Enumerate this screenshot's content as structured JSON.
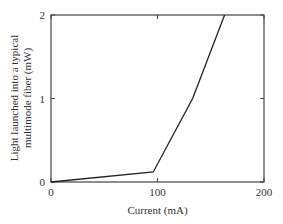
{
  "chart_data": {
    "type": "line",
    "title": "",
    "xlabel": "Current (mA)",
    "ylabel_lines": [
      "Light launched into a typical",
      "multimode fiber (mW)"
    ],
    "ylabel": "Light launched into a typical multimode fiber (mW)",
    "xlim": [
      0,
      200
    ],
    "ylim": [
      0,
      2
    ],
    "x_ticks": [
      0,
      100,
      200
    ],
    "x_tick_labels": [
      "0",
      "100",
      "200"
    ],
    "y_ticks": [
      0,
      1,
      2
    ],
    "y_tick_labels": [
      "0",
      "1",
      "2"
    ],
    "grid": false,
    "legend": null,
    "series": [
      {
        "name": "LED/laser output",
        "x": [
          0,
          96,
          133,
          163
        ],
        "y": [
          0,
          0.12,
          1.0,
          2.0
        ]
      }
    ]
  },
  "colors": {
    "line": "#222222",
    "frame": "#444444"
  }
}
